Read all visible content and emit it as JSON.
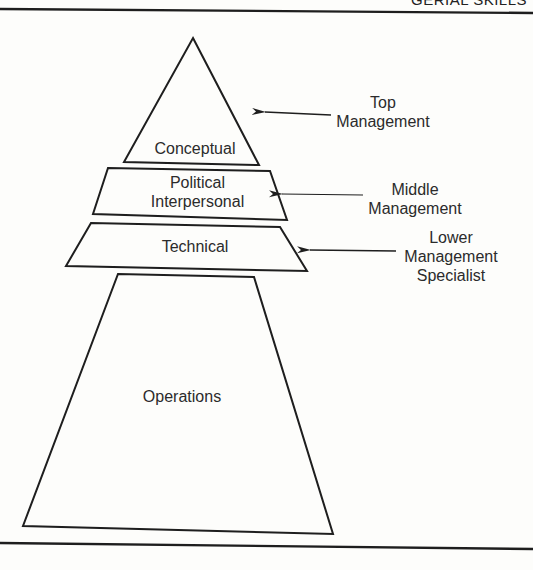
{
  "header": {
    "running_title": "GERIAL SKILLS"
  },
  "diagram": {
    "title": "",
    "type": "pyramid",
    "tiers": [
      {
        "id": "conceptual",
        "lines": [
          "Conceptual"
        ]
      },
      {
        "id": "political",
        "lines": [
          "Political",
          "Interpersonal"
        ]
      },
      {
        "id": "technical",
        "lines": [
          "Technical"
        ]
      },
      {
        "id": "operations",
        "lines": [
          "Operations"
        ]
      }
    ],
    "levels": [
      {
        "id": "top",
        "lines": [
          "Top",
          "Management"
        ],
        "points_to": "conceptual"
      },
      {
        "id": "middle",
        "lines": [
          "Middle",
          "Management"
        ],
        "points_to": "political"
      },
      {
        "id": "lower",
        "lines": [
          "Lower",
          "Management",
          "Specialist"
        ],
        "points_to": "technical"
      }
    ],
    "stroke_color": "#1e1e1e",
    "background_color": "#fdfdfb"
  }
}
